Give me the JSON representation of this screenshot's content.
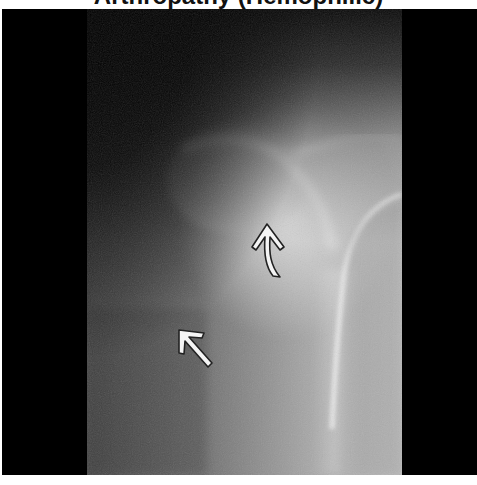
{
  "figure": {
    "title_partial": "Arthropathy (Hemophilic)",
    "image_description": "Radiograph of hip/shoulder joint showing joint region with arrows indicating findings",
    "annotations": [
      {
        "type": "arrow",
        "direction": "up",
        "shape": "curved-tail",
        "color": "#ffffff",
        "position": "center-right near joint"
      },
      {
        "type": "arrow",
        "direction": "up-left",
        "shape": "straight",
        "color": "#ffffff",
        "position": "lower-left"
      }
    ],
    "colors": {
      "background": "#ffffff",
      "frame": "#000000",
      "arrow_fill": "#f4f4f4",
      "arrow_outline": "#222222"
    }
  }
}
